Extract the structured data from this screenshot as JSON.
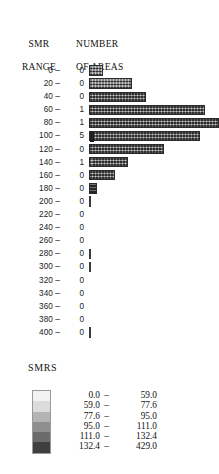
{
  "figure": {
    "headers": {
      "smr_range_line1": "SMR",
      "smr_range_line2": "RANGE",
      "number_line1": "NUMBER",
      "number_line2": "OF AREAS"
    },
    "tick_dash": "–"
  },
  "chart_data": {
    "type": "bar",
    "orientation": "horizontal",
    "title": "",
    "xlabel": "NUMBER OF AREAS",
    "ylabel": "SMR RANGE",
    "grid": false,
    "categories": [
      "0",
      "20",
      "40",
      "60",
      "80",
      "100",
      "120",
      "140",
      "160",
      "180",
      "200",
      "220",
      "240",
      "260",
      "280",
      "300",
      "320",
      "340",
      "360",
      "380",
      "400"
    ],
    "tick_labels": [
      "0 –",
      "20 –",
      "40 –",
      "60 –",
      "80 –",
      "100 –",
      "120 –",
      "140 –",
      "160 –",
      "180 –",
      "200 –",
      "220 –",
      "240 –",
      "260 –",
      "280 –",
      "300 –",
      "320 –",
      "340 –",
      "360 –",
      "380 –",
      "400 –"
    ],
    "annotation_label": "NUMBER OF AREAS",
    "annotations": [
      "0",
      "0",
      "0",
      "1",
      "1",
      "5",
      "0",
      "1",
      "0",
      "0",
      "0",
      "0",
      "0",
      "0",
      "0",
      "0",
      "0",
      "0",
      "0",
      "0",
      "0"
    ],
    "values": [
      14,
      43,
      57,
      116,
      130,
      111,
      75,
      39,
      26,
      8,
      1,
      0,
      0,
      0,
      1,
      1,
      0,
      0,
      0,
      0,
      1
    ],
    "xlim": [
      0,
      130
    ],
    "bar_styles": [
      "hatch",
      "hatch",
      "hatch",
      "hatch",
      "hatch",
      "hatch-cap",
      "hatch",
      "hatch",
      "hatch",
      "solid-dark",
      "thin",
      "none",
      "none",
      "none",
      "thin",
      "thin",
      "none",
      "none",
      "none",
      "none",
      "thin"
    ]
  },
  "legend": {
    "title": "SMRS",
    "entries": [
      {
        "low": "0.0",
        "dash": "–",
        "high": "59.0",
        "color": "#f2f2f2"
      },
      {
        "low": "59.0",
        "dash": "–",
        "high": "77.6",
        "color": "#dcdcdc"
      },
      {
        "low": "77.6",
        "dash": "–",
        "high": "95.0",
        "color": "#b4b4b4"
      },
      {
        "low": "95.0",
        "dash": "–",
        "high": "111.0",
        "color": "#8f8f8f"
      },
      {
        "low": "111.0",
        "dash": "–",
        "high": "132.4",
        "color": "#6b6b6b"
      },
      {
        "low": "132.4",
        "dash": "–",
        "high": "429.0",
        "color": "#3f3f3f"
      }
    ]
  }
}
